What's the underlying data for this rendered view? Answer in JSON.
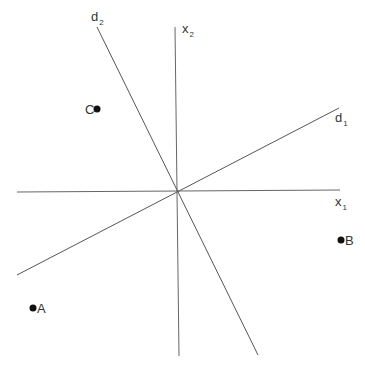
{
  "diagram": {
    "title": "",
    "colors": {
      "line": "#555555",
      "point": "#111111",
      "text": "#333333",
      "background": "#ffffff"
    },
    "axes": {
      "x1": {
        "label": "x",
        "subscript": "1"
      },
      "x2": {
        "label": "x",
        "subscript": "2"
      }
    },
    "directions": {
      "d1": {
        "label": "d",
        "subscript": "1"
      },
      "d2": {
        "label": "d",
        "subscript": "2"
      }
    },
    "points": [
      {
        "label": "A",
        "x": 33,
        "y": 308
      },
      {
        "label": "B",
        "x": 341,
        "y": 240
      },
      {
        "label": "C",
        "x": 97,
        "y": 109
      }
    ]
  }
}
